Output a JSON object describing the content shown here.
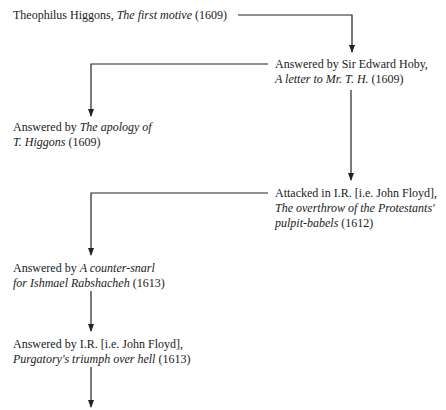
{
  "diagram": {
    "type": "flowchart",
    "line_color": "#222222",
    "nodes": [
      {
        "id": "n1",
        "lines": [
          [
            {
              "t": "Theophilus Higgons, ",
              "i": false
            },
            {
              "t": "The first motive",
              "i": true
            },
            {
              "t": " (1609)",
              "i": false
            }
          ]
        ]
      },
      {
        "id": "n2",
        "lines": [
          [
            {
              "t": "Answered by Sir Edward Hoby,",
              "i": false
            }
          ],
          [
            {
              "t": "A letter to Mr. T. H.",
              "i": true
            },
            {
              "t": " (1609)",
              "i": false
            }
          ]
        ]
      },
      {
        "id": "n3",
        "lines": [
          [
            {
              "t": "Answered by ",
              "i": false
            },
            {
              "t": "The apology of",
              "i": true
            }
          ],
          [
            {
              "t": "T. Higgons",
              "i": true
            },
            {
              "t": " (1609)",
              "i": false
            }
          ]
        ]
      },
      {
        "id": "n4",
        "lines": [
          [
            {
              "t": "Attacked in I.R. [i.e. John Floyd],",
              "i": false
            }
          ],
          [
            {
              "t": "The overthrow of the Protestants'",
              "i": true
            }
          ],
          [
            {
              "t": "pulpit-babels",
              "i": true
            },
            {
              "t": " (1612)",
              "i": false
            }
          ]
        ]
      },
      {
        "id": "n5",
        "lines": [
          [
            {
              "t": "Answered by ",
              "i": false
            },
            {
              "t": "A counter-snarl",
              "i": true
            }
          ],
          [
            {
              "t": "for Ishmael Rabshacheh",
              "i": true
            },
            {
              "t": " (1613)",
              "i": false
            }
          ]
        ]
      },
      {
        "id": "n6",
        "lines": [
          [
            {
              "t": "Answered by I.R. [i.e. John Floyd],",
              "i": false
            }
          ],
          [
            {
              "t": "Purgatory's triumph over hell",
              "i": true
            },
            {
              "t": " (1613)",
              "i": false
            }
          ]
        ]
      }
    ],
    "edges": [
      {
        "from": "n1",
        "to": "n2"
      },
      {
        "from": "n2",
        "to": "n3"
      },
      {
        "from": "n2",
        "to": "n4"
      },
      {
        "from": "n4",
        "to": "n5"
      },
      {
        "from": "n5",
        "to": "n6"
      },
      {
        "from": "n6",
        "to": "continuation"
      }
    ]
  }
}
